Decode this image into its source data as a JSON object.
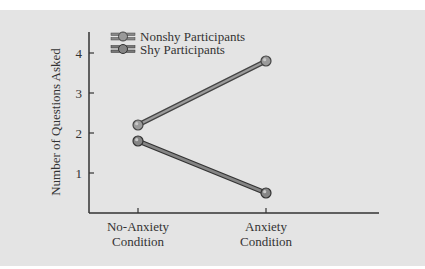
{
  "chart_data": {
    "type": "line",
    "title": "",
    "xlabel": "",
    "ylabel": "Number of Questions Asked",
    "categories": [
      "No-Anxiety Condition",
      "Anxiety Condition"
    ],
    "category_lines": [
      [
        "No-Anxiety",
        "Condition"
      ],
      [
        "Anxiety",
        "Condition"
      ]
    ],
    "series": [
      {
        "name": "Nonshy Participants",
        "values": [
          2.2,
          3.8
        ]
      },
      {
        "name": "Shy Participants",
        "values": [
          1.8,
          0.5
        ]
      }
    ],
    "ylim": [
      0,
      4.5
    ],
    "yticks": [
      1,
      2,
      3,
      4
    ],
    "grid": false,
    "legend_position": "upper-left"
  },
  "colors": {
    "background": "#e4e4e4",
    "line": "#8a8a8a",
    "line_outline": "#3a3a3a",
    "axis": "#333333"
  }
}
